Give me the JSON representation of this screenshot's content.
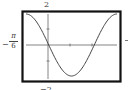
{
  "chart_data": {
    "type": "line",
    "title": "",
    "function": "y = -2 sin(3x)",
    "xlabel": "",
    "ylabel": "",
    "xlim_labels": {
      "left": "-π/6"
    },
    "ylim": [
      -2,
      2
    ],
    "ylim_labels": {
      "top": "2",
      "bottom": "-2"
    },
    "grid": false,
    "axes_ticks": true,
    "series": [
      {
        "name": "curve",
        "x": [
          -0.5236,
          -0.3927,
          -0.2618,
          -0.1309,
          0,
          0.1309,
          0.2618,
          0.3927,
          0.5236,
          0.6545,
          0.7854,
          0.9163,
          1.0472,
          1.1781,
          1.309,
          1.4399,
          1.5708
        ],
        "values": [
          2,
          1.85,
          1.41,
          0.77,
          0,
          -0.77,
          -1.41,
          -1.85,
          -2,
          -1.85,
          -1.41,
          -0.77,
          0,
          0.77,
          1.41,
          1.85,
          2
        ]
      }
    ]
  },
  "labels": {
    "y_top": "2",
    "y_bottom": "−2",
    "x_left_sign": "−",
    "x_left_num": "π",
    "x_left_den": "6"
  },
  "colors": {
    "frame": "#111111",
    "axis": "#555555",
    "curve": "#444444",
    "background": "#ffffff"
  }
}
